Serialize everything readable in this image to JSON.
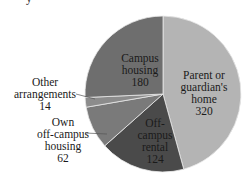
{
  "chart_data": {
    "type": "pie",
    "title": "",
    "start_angle_deg": 0,
    "direction": "clockwise",
    "slices": [
      {
        "label": "Parent or guardian's home",
        "value": 320,
        "color": "#b4b4b4"
      },
      {
        "label": "Off-campus rental",
        "value": 124,
        "color": "#4a4a4a"
      },
      {
        "label": "Own off-campus housing",
        "value": 62,
        "color": "#7a7a7a"
      },
      {
        "label": "Other arrangements",
        "value": 14,
        "color": "#8c8c8c"
      },
      {
        "label": "Campus housing",
        "value": 180,
        "color": "#6e6e6e"
      }
    ],
    "total": 700,
    "legend": "none (inline labels)"
  },
  "labels": {
    "campus": {
      "l1": "Campus",
      "l2": "housing",
      "v": "180"
    },
    "parent": {
      "l1": "Parent or",
      "l2": "guardian's",
      "l3": "home",
      "v": "320"
    },
    "offrental": {
      "l1": "Off-",
      "l2": "campus",
      "l3": "rental",
      "v": "124"
    },
    "own": {
      "l1": "Own",
      "l2": "off-campus",
      "l3": "housing",
      "v": "62"
    },
    "other": {
      "l1": "Other",
      "l2": "arrangements",
      "v": "14"
    }
  },
  "fragment": "y"
}
